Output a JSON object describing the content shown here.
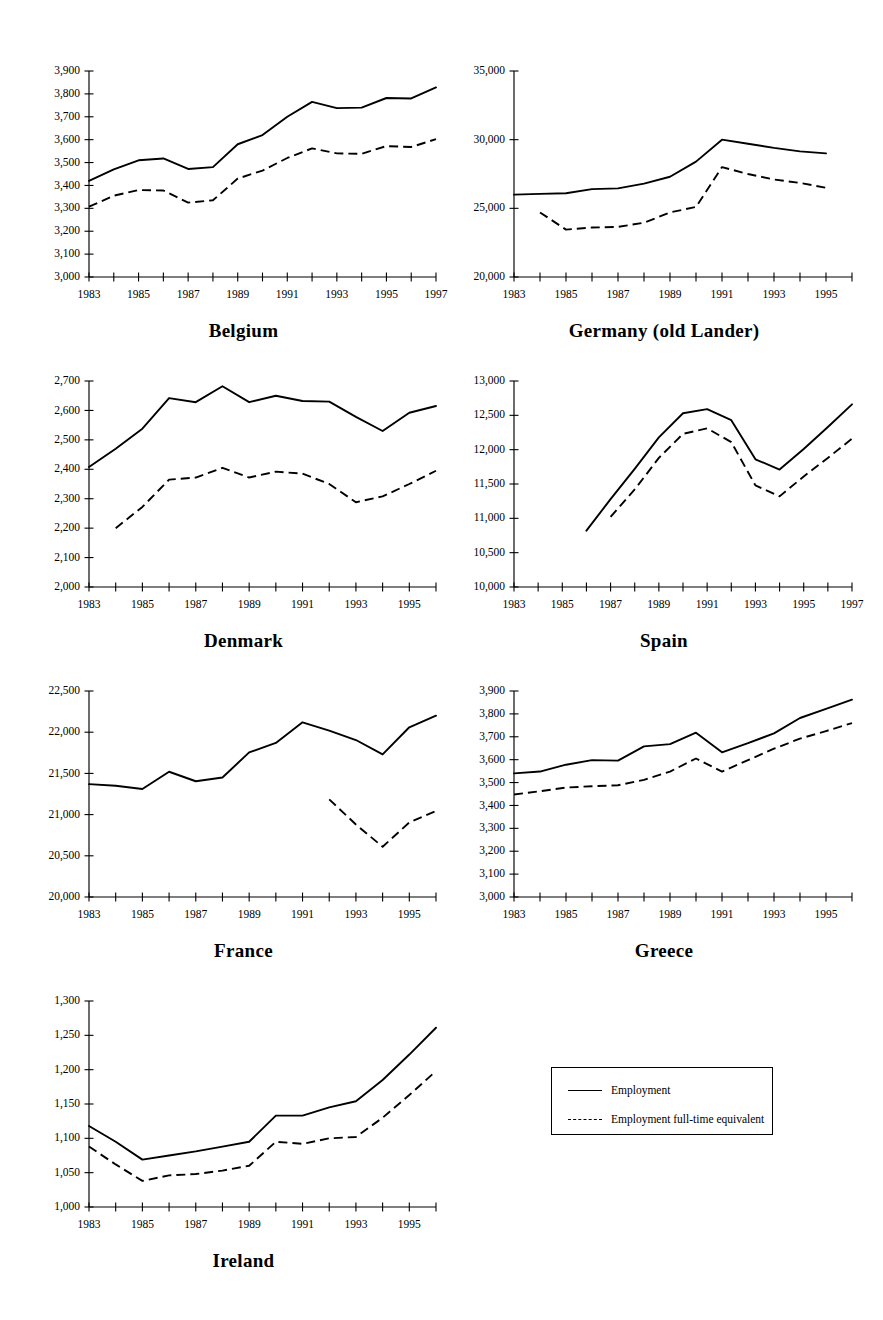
{
  "figure": {
    "legend": {
      "items": [
        {
          "label": "Employment",
          "style": "solid"
        },
        {
          "label": "Employment full-time equivalent",
          "style": "dashed"
        }
      ]
    }
  },
  "chart_data": [
    {
      "type": "line",
      "title": "Belgium",
      "xlabel": "",
      "ylabel": "",
      "xlim": [
        1983,
        1997
      ],
      "ylim": [
        3000,
        3900
      ],
      "ytick_step": 100,
      "ytick_labels": [
        "3,000",
        "3,100",
        "3,200",
        "3,300",
        "3,400",
        "3,500",
        "3,600",
        "3,700",
        "3,800",
        "3,900"
      ],
      "xtick_labels": [
        "1983",
        "1985",
        "1987",
        "1989",
        "1991",
        "1993",
        "1995",
        "1997"
      ],
      "xtick_label_step": 2,
      "grid": false,
      "legend_position": "external",
      "x": [
        1983,
        1984,
        1985,
        1986,
        1987,
        1988,
        1989,
        1990,
        1991,
        1992,
        1993,
        1994,
        1995,
        1996,
        1997
      ],
      "series": [
        {
          "name": "Employment",
          "style": "solid",
          "values": [
            3420,
            3470,
            3510,
            3518,
            3472,
            3480,
            3580,
            3620,
            3700,
            3765,
            3738,
            3740,
            3782,
            3780,
            3828
          ]
        },
        {
          "name": "Employment full-time equivalent",
          "style": "dashed",
          "values": [
            3307,
            3355,
            3380,
            3378,
            3325,
            3335,
            3430,
            3465,
            3520,
            3562,
            3540,
            3538,
            3572,
            3568,
            3602
          ]
        }
      ]
    },
    {
      "type": "line",
      "title": "Germany (old Lander)",
      "xlabel": "",
      "ylabel": "",
      "xlim": [
        1983,
        1996
      ],
      "ylim": [
        20000,
        35000
      ],
      "ytick_step": 5000,
      "ytick_labels": [
        "20,000",
        "25,000",
        "30,000",
        "35,000"
      ],
      "xtick_labels": [
        "1983",
        "1985",
        "1987",
        "1989",
        "1991",
        "1993",
        "1995"
      ],
      "xtick_label_step": 2,
      "grid": false,
      "legend_position": "external",
      "x": [
        1983,
        1984,
        1985,
        1986,
        1987,
        1988,
        1989,
        1990,
        1991,
        1992,
        1993,
        1994,
        1995,
        1996
      ],
      "series": [
        {
          "name": "Employment",
          "style": "solid",
          "values": [
            26000,
            26050,
            26100,
            26400,
            26450,
            26800,
            27300,
            28400,
            30000,
            29700,
            29400,
            29150,
            29000,
            null
          ]
        },
        {
          "name": "Employment full-time equivalent",
          "style": "dashed",
          "values": [
            null,
            24700,
            23450,
            23600,
            23650,
            23950,
            24700,
            25100,
            28000,
            27500,
            27100,
            26850,
            26500,
            null
          ]
        }
      ]
    },
    {
      "type": "line",
      "title": "Denmark",
      "xlabel": "",
      "ylabel": "",
      "xlim": [
        1983,
        1996
      ],
      "ylim": [
        2000,
        2700
      ],
      "ytick_step": 100,
      "ytick_labels": [
        "2,000",
        "2,100",
        "2,200",
        "2,300",
        "2,400",
        "2,500",
        "2,600",
        "2,700"
      ],
      "xtick_labels": [
        "1983",
        "1985",
        "1987",
        "1989",
        "1991",
        "1993",
        "1995"
      ],
      "xtick_label_step": 2,
      "grid": false,
      "legend_position": "external",
      "x": [
        1983,
        1984,
        1985,
        1986,
        1987,
        1988,
        1989,
        1990,
        1991,
        1992,
        1993,
        1994,
        1995,
        1996
      ],
      "series": [
        {
          "name": "Employment",
          "style": "solid",
          "values": [
            2408,
            2470,
            2538,
            2642,
            2628,
            2682,
            2628,
            2650,
            2632,
            2630,
            2578,
            2530,
            2592,
            2615
          ]
        },
        {
          "name": "Employment full-time equivalent",
          "style": "dashed",
          "values": [
            null,
            2200,
            2272,
            2365,
            2372,
            2405,
            2372,
            2392,
            2385,
            2350,
            2288,
            2308,
            2350,
            2395
          ]
        }
      ]
    },
    {
      "type": "line",
      "title": "Spain",
      "xlabel": "",
      "ylabel": "",
      "xlim": [
        1983,
        1997
      ],
      "ylim": [
        10000,
        13000
      ],
      "ytick_step": 500,
      "ytick_labels": [
        "10,000",
        "10,500",
        "11,000",
        "11,500",
        "12,000",
        "12,500",
        "13,000"
      ],
      "xtick_labels": [
        "1983",
        "1985",
        "1987",
        "1989",
        "1991",
        "1993",
        "1995",
        "1997"
      ],
      "xtick_label_step": 2,
      "grid": false,
      "legend_position": "external",
      "x": [
        1983,
        1984,
        1985,
        1986,
        1987,
        1988,
        1989,
        1990,
        1991,
        1992,
        1993,
        1994,
        1995,
        1996,
        1997
      ],
      "series": [
        {
          "name": "Employment",
          "style": "solid",
          "values": [
            null,
            null,
            null,
            10820,
            11280,
            11720,
            12180,
            12530,
            12590,
            12430,
            11860,
            11710,
            12010,
            12330,
            12660
          ]
        },
        {
          "name": "Employment full-time equivalent",
          "style": "dashed",
          "values": [
            null,
            null,
            null,
            null,
            11020,
            11420,
            11880,
            12230,
            12310,
            12110,
            11480,
            11320,
            11610,
            11880,
            12160
          ]
        }
      ]
    },
    {
      "type": "line",
      "title": "France",
      "xlabel": "",
      "ylabel": "",
      "xlim": [
        1983,
        1996
      ],
      "ylim": [
        20000,
        22500
      ],
      "ytick_step": 500,
      "ytick_labels": [
        "20,000",
        "20,500",
        "21,000",
        "21,500",
        "22,000",
        "22,500"
      ],
      "xtick_labels": [
        "1983",
        "1985",
        "1987",
        "1989",
        "1991",
        "1993",
        "1995"
      ],
      "xtick_label_step": 2,
      "grid": false,
      "legend_position": "external",
      "x": [
        1983,
        1984,
        1985,
        1986,
        1987,
        1988,
        1989,
        1990,
        1991,
        1992,
        1993,
        1994,
        1995,
        1996
      ],
      "series": [
        {
          "name": "Employment",
          "style": "solid",
          "values": [
            21370,
            21350,
            21310,
            21520,
            21405,
            21450,
            21755,
            21870,
            22120,
            22020,
            21905,
            21730,
            22060,
            22200
          ]
        },
        {
          "name": "Employment full-time equivalent",
          "style": "dashed",
          "values": [
            null,
            null,
            null,
            null,
            null,
            null,
            null,
            null,
            null,
            21185,
            20880,
            20610,
            20905,
            21045
          ]
        }
      ]
    },
    {
      "type": "line",
      "title": "Greece",
      "xlabel": "",
      "ylabel": "",
      "xlim": [
        1983,
        1996
      ],
      "ylim": [
        3000,
        3900
      ],
      "ytick_step": 100,
      "ytick_labels": [
        "3,000",
        "3,100",
        "3,200",
        "3,300",
        "3,400",
        "3,500",
        "3,600",
        "3,700",
        "3,800",
        "3,900"
      ],
      "xtick_labels": [
        "1983",
        "1985",
        "1987",
        "1989",
        "1991",
        "1993",
        "1995"
      ],
      "xtick_label_step": 2,
      "grid": false,
      "legend_position": "external",
      "x": [
        1983,
        1984,
        1985,
        1986,
        1987,
        1988,
        1989,
        1990,
        1991,
        1992,
        1993,
        1994,
        1995,
        1996
      ],
      "series": [
        {
          "name": "Employment",
          "style": "solid",
          "values": [
            3540,
            3548,
            3578,
            3598,
            3596,
            3658,
            3668,
            3718,
            3632,
            3672,
            3715,
            3782,
            3822,
            3862
          ]
        },
        {
          "name": "Employment full-time equivalent",
          "style": "dashed",
          "values": [
            3448,
            3462,
            3478,
            3484,
            3488,
            3512,
            3548,
            3605,
            3548,
            3598,
            3648,
            3692,
            3725,
            3760
          ]
        }
      ]
    },
    {
      "type": "line",
      "title": "Ireland",
      "xlabel": "",
      "ylabel": "",
      "xlim": [
        1983,
        1996
      ],
      "ylim": [
        1000,
        1300
      ],
      "ytick_step": 50,
      "ytick_labels": [
        "1,000",
        "1,050",
        "1,100",
        "1,150",
        "1,200",
        "1,250",
        "1,300"
      ],
      "xtick_labels": [
        "1983",
        "1985",
        "1987",
        "1989",
        "1991",
        "1993",
        "1995"
      ],
      "xtick_label_step": 2,
      "grid": false,
      "legend_position": "external",
      "x": [
        1983,
        1984,
        1985,
        1986,
        1987,
        1988,
        1989,
        1990,
        1991,
        1992,
        1993,
        1994,
        1995,
        1996
      ],
      "series": [
        {
          "name": "Employment",
          "style": "solid",
          "values": [
            1118,
            1095,
            1069,
            1075,
            1081,
            1088,
            1095,
            1133,
            1133,
            1145,
            1154,
            1185,
            1222,
            1261
          ]
        },
        {
          "name": "Employment full-time equivalent",
          "style": "dashed",
          "values": [
            1088,
            1062,
            1038,
            1046,
            1048,
            1053,
            1060,
            1095,
            1092,
            1100,
            1102,
            1130,
            1163,
            1198
          ]
        }
      ]
    }
  ]
}
